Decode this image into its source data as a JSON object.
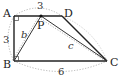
{
  "diagram": {
    "type": "geometry-figure",
    "shape": "trapezoid ABCD with inscribed point P on AD",
    "vertices": {
      "A": {
        "label": "A",
        "x": 14,
        "y": 16
      },
      "D": {
        "label": "D",
        "x": 62,
        "y": 16
      },
      "B": {
        "label": "B",
        "x": 14,
        "y": 61
      },
      "C": {
        "label": "C",
        "x": 107,
        "y": 61
      },
      "P": {
        "label": "P",
        "x": 41,
        "y": 16
      }
    },
    "segment_labels": {
      "AP": "3",
      "AB": "3",
      "BC": "6",
      "BP": "b",
      "PC": "c"
    },
    "right_angles": [
      "A",
      "B"
    ],
    "colors": {
      "line": "#222222",
      "dotted": "#aaaaaa"
    }
  }
}
